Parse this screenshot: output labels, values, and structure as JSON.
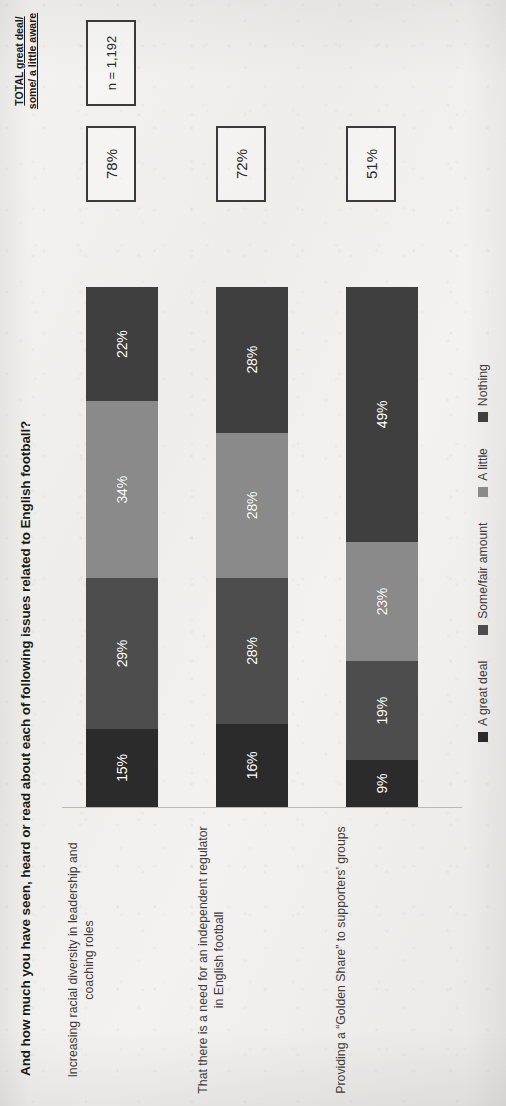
{
  "header": {
    "question": "And how much you have seen, heard or read about each of following issues related to English football?",
    "total_label": "TOTAL great deal/ some/ a little aware",
    "base_note": "n = 1,192"
  },
  "chart_data": {
    "type": "bar",
    "subtype": "stacked-horizontal-100",
    "title": "And how much you have seen, heard or read about each of following issues related to English football?",
    "xlabel": "",
    "ylabel": "",
    "xlim": [
      0,
      100
    ],
    "grid": false,
    "legend_position": "bottom",
    "categories": [
      "Increasing racial diversity in leadership and coaching roles",
      "That there is a need for an independent regulator in English football",
      "Providing a “Golden Share” to supporters’ groups"
    ],
    "series": [
      {
        "name": "A great deal",
        "color": "#2b2b2b",
        "values": [
          15,
          16,
          9
        ],
        "labels": [
          "15%",
          "16%",
          "9%"
        ]
      },
      {
        "name": "Some/fair amount",
        "color": "#4d4d4d",
        "values": [
          29,
          28,
          19
        ],
        "labels": [
          "29%",
          "28%",
          "19%"
        ]
      },
      {
        "name": "A little",
        "color": "#8a8a8a",
        "values": [
          34,
          28,
          23
        ],
        "labels": [
          "34%",
          "28%",
          "23%"
        ]
      },
      {
        "name": "Nothing",
        "color": "#3f3f3f",
        "values": [
          22,
          28,
          49
        ],
        "labels": [
          "22%",
          "28%",
          "49%"
        ]
      }
    ],
    "totals": {
      "header": "TOTAL great deal/ some/ a little aware",
      "values": [
        "78%",
        "72%",
        "51%"
      ]
    },
    "base": "n = 1,192"
  }
}
